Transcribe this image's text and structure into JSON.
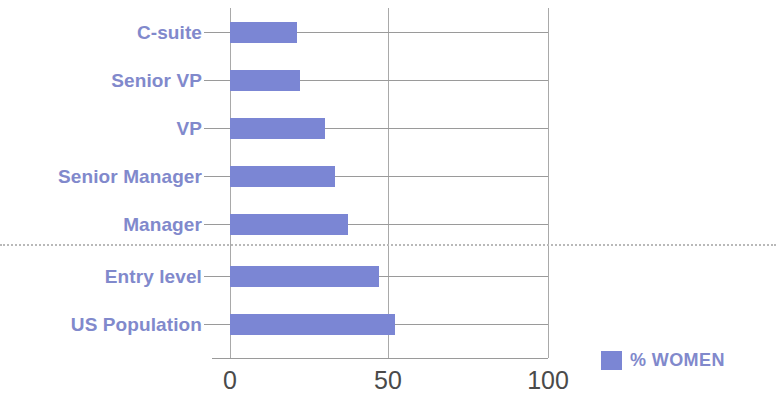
{
  "chart_data": {
    "type": "bar",
    "orientation": "horizontal",
    "title": "",
    "subtitle": "",
    "xlabel": "",
    "ylabel": "",
    "xlim": [
      0,
      100
    ],
    "xticks": [
      "0",
      "50",
      "100"
    ],
    "grid": true,
    "legend_position": "bottom-right",
    "categories": [
      "C-suite",
      "Senior VP",
      "VP",
      "Senior Manager",
      "Manager",
      "Entry level",
      "US Population"
    ],
    "series": [
      {
        "name": "% WOMEN",
        "color": "#7b86d4",
        "values": [
          21,
          22,
          30,
          33,
          37,
          47,
          52
        ]
      }
    ],
    "annotations": [
      {
        "type": "divider",
        "style": "dotted",
        "between": [
          "Manager",
          "Entry level"
        ]
      }
    ]
  },
  "legend": {
    "label": "% WOMEN",
    "swatch_color": "#7b86d4"
  },
  "colors": {
    "bar": "#7b86d4",
    "label_text": "#8189cc",
    "tick_text": "#4a4a4a",
    "gridline": "#9a9a9a",
    "divider": "#b9b9b9",
    "background": "#ffffff"
  }
}
